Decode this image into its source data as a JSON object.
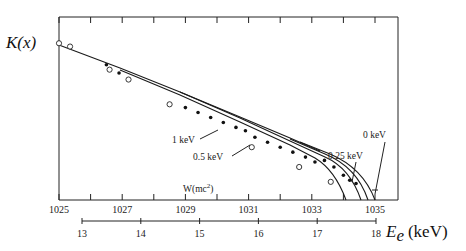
{
  "chart_data": {
    "type": "scatter",
    "title": "",
    "ylabel": "K(x)",
    "xlabel_primary": "W(mc²)",
    "xlabel_secondary": "E_e (keV)",
    "x_primary_ticks": [
      1025,
      1026,
      1027,
      1028,
      1029,
      1030,
      1031,
      1032,
      1033,
      1034,
      1035
    ],
    "x_primary_tick_labels": [
      "1025",
      "1027",
      "1029",
      "1031",
      "1033",
      "1035"
    ],
    "x_primary_range": [
      1025,
      1035.8
    ],
    "x_secondary_ticks": [
      13,
      14,
      15,
      16,
      17,
      18
    ],
    "x_secondary_tick_labels": [
      "13",
      "14",
      "15",
      "16",
      "17",
      "18"
    ],
    "grid": false,
    "yticks": "none (top frame tick marks only)",
    "series": [
      {
        "name": "1 keV",
        "kind": "curve",
        "endpoint_W": 1034.0
      },
      {
        "name": "0.5 keV",
        "kind": "curve",
        "endpoint_W": 1034.5
      },
      {
        "name": "0.25 keV",
        "kind": "curve",
        "endpoint_W": 1034.8
      },
      {
        "name": "0 keV",
        "kind": "curve",
        "endpoint_W": 1035.0
      },
      {
        "name": "data (open circles)",
        "kind": "points",
        "marker": "open-circle",
        "x": [
          1025.0,
          1025.35,
          1026.6,
          1027.2,
          1028.5,
          1031.1,
          1032.6,
          1033.6
        ],
        "y": [
          0.95,
          0.93,
          0.79,
          0.73,
          0.58,
          0.32,
          0.2,
          0.11
        ]
      },
      {
        "name": "data (filled dots)",
        "kind": "points",
        "marker": "filled-dot",
        "x": [
          1026.5,
          1026.9,
          1029.0,
          1029.4,
          1029.8,
          1030.2,
          1030.6,
          1030.9,
          1031.2,
          1031.6,
          1032.0,
          1032.4,
          1032.8,
          1033.1,
          1033.4,
          1033.7,
          1034.0,
          1034.2,
          1034.4
        ],
        "y": [
          0.82,
          0.77,
          0.56,
          0.53,
          0.5,
          0.47,
          0.44,
          0.42,
          0.38,
          0.35,
          0.32,
          0.29,
          0.26,
          0.23,
          0.24,
          0.2,
          0.15,
          0.12,
          0.1
        ]
      }
    ],
    "annotations": [
      "1 keV",
      "0.5 keV",
      "0.25 keV",
      "0 keV"
    ]
  },
  "labels": {
    "y_axis": "K(x)",
    "w_axis": "W(mc",
    "w_axis_sup": "2",
    "w_axis_close": ")",
    "ee_axis_E": "E",
    "ee_axis_sub": "e",
    "ee_axis_unit": "(keV)",
    "ann_1kev": "1 keV",
    "ann_05kev": "0.5 keV",
    "ann_025kev": "0.25 keV",
    "ann_0kev": "0 keV"
  }
}
